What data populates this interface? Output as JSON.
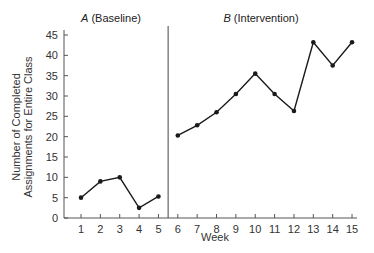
{
  "chart_data": {
    "type": "line",
    "title": "",
    "xlabel": "Week",
    "ylabel": [
      "Number of Completed",
      "Assignments for Entire Class"
    ],
    "ylim": [
      0,
      45
    ],
    "yticks": [
      0,
      5,
      10,
      15,
      20,
      25,
      30,
      35,
      40,
      45
    ],
    "xticks": [
      1,
      2,
      3,
      4,
      5,
      6,
      7,
      8,
      9,
      10,
      11,
      12,
      13,
      14,
      15
    ],
    "grid": false,
    "phase_change_after_week": 5,
    "phases": [
      {
        "letter": "A",
        "name": "(Baseline)",
        "x": [
          1,
          2,
          3,
          4,
          5
        ],
        "values": [
          5,
          9,
          10,
          2.5,
          5.3
        ]
      },
      {
        "letter": "B",
        "name": "(Intervention)",
        "x": [
          6,
          7,
          8,
          9,
          10,
          11,
          12,
          13,
          14,
          15
        ],
        "values": [
          20.3,
          22.8,
          26,
          30.5,
          35.5,
          30.5,
          26.3,
          43.2,
          37.5,
          43.2
        ]
      }
    ],
    "line_color": "#1a1a1a"
  }
}
